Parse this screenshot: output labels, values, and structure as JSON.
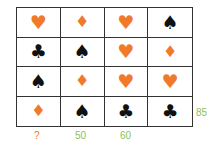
{
  "colors": {
    "orange": "#f07a2a",
    "black": "#111111",
    "green": "#8dbf5a"
  },
  "grid": [
    [
      {
        "suit": "heart",
        "glyph": "♥"
      },
      {
        "suit": "diamond",
        "glyph": "♦"
      },
      {
        "suit": "heart",
        "glyph": "♥"
      },
      {
        "suit": "spade",
        "glyph": "♠"
      }
    ],
    [
      {
        "suit": "club",
        "glyph": "♣"
      },
      {
        "suit": "spade",
        "glyph": "♠"
      },
      {
        "suit": "heart",
        "glyph": "♥"
      },
      {
        "suit": "diamond",
        "glyph": "♦"
      }
    ],
    [
      {
        "suit": "spade",
        "glyph": "♠"
      },
      {
        "suit": "diamond",
        "glyph": "♦"
      },
      {
        "suit": "heart",
        "glyph": "♥"
      },
      {
        "suit": "heart",
        "glyph": "♥"
      }
    ],
    [
      {
        "suit": "diamond",
        "glyph": "♦"
      },
      {
        "suit": "spade",
        "glyph": "♠"
      },
      {
        "suit": "club",
        "glyph": "♣"
      },
      {
        "suit": "club",
        "glyph": "♣"
      }
    ]
  ],
  "column_labels": [
    "?",
    "50",
    "60",
    ""
  ],
  "row_labels": [
    "",
    "",
    "",
    "85"
  ]
}
